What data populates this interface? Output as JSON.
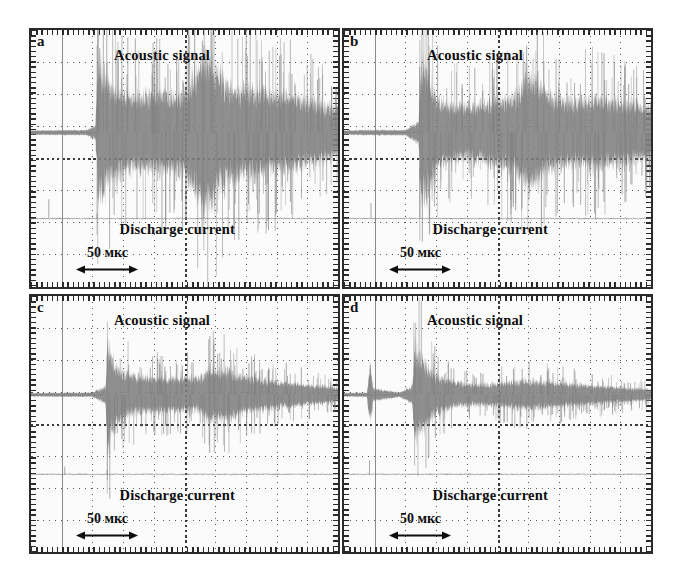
{
  "figure": {
    "type": "oscilloscope-traces",
    "background_color": "#ffffff",
    "trace_color": "#808080",
    "grid_color": "#555555",
    "border_color": "#2a2a2a"
  },
  "common": {
    "acoustic_label": "Acoustic signal",
    "discharge_label": "Discharge current",
    "scalebar_label": "50 мкс",
    "scalebar_arrow": "double-headed-arrow",
    "grid_columns": 10,
    "grid_rows": 8
  },
  "panels": [
    {
      "letter": "a",
      "acoustic_label": "Acoustic signal",
      "discharge_label": "Discharge current",
      "scalebar_label": "50 мкс"
    },
    {
      "letter": "b",
      "acoustic_label": "Acoustic signal",
      "discharge_label": "Discharge current",
      "scalebar_label": "50 мкс"
    },
    {
      "letter": "c",
      "acoustic_label": "Acoustic signal",
      "discharge_label": "Discharge current",
      "scalebar_label": "50 мкс"
    },
    {
      "letter": "d",
      "acoustic_label": "Acoustic signal",
      "discharge_label": "Discharge current",
      "scalebar_label": "50 мкс"
    }
  ],
  "chart_data": {
    "type": "line",
    "title": "",
    "xlabel": "Time",
    "ylabel": "Amplitude",
    "x_scale_bar_us": 50,
    "x_scale_bar_label": "50 мкс",
    "grid": true,
    "legend_position": "in-plot-annotations",
    "panels": [
      {
        "id": "a",
        "traces": [
          {
            "name": "Acoustic signal",
            "baseline_frac": 0.4,
            "onset_frac": 0.215,
            "peak_amplitude_frac": 0.36,
            "envelope": [
              {
                "x": 0.0,
                "amp": 0.01
              },
              {
                "x": 0.18,
                "amp": 0.012
              },
              {
                "x": 0.21,
                "amp": 0.03
              },
              {
                "x": 0.218,
                "amp": 0.33
              },
              {
                "x": 0.235,
                "amp": 0.3
              },
              {
                "x": 0.255,
                "amp": 0.215
              },
              {
                "x": 0.29,
                "amp": 0.19
              },
              {
                "x": 0.33,
                "amp": 0.175
              },
              {
                "x": 0.38,
                "amp": 0.17
              },
              {
                "x": 0.43,
                "amp": 0.185
              },
              {
                "x": 0.47,
                "amp": 0.165
              },
              {
                "x": 0.505,
                "amp": 0.195
              },
              {
                "x": 0.545,
                "amp": 0.3
              },
              {
                "x": 0.565,
                "amp": 0.36
              },
              {
                "x": 0.59,
                "amp": 0.34
              },
              {
                "x": 0.615,
                "amp": 0.265
              },
              {
                "x": 0.65,
                "amp": 0.215
              },
              {
                "x": 0.7,
                "amp": 0.2
              },
              {
                "x": 0.75,
                "amp": 0.19
              },
              {
                "x": 0.8,
                "amp": 0.18
              },
              {
                "x": 0.85,
                "amp": 0.17
              },
              {
                "x": 0.9,
                "amp": 0.15
              },
              {
                "x": 0.95,
                "amp": 0.13
              },
              {
                "x": 1.0,
                "amp": 0.11
              }
            ]
          },
          {
            "name": "Discharge current",
            "baseline_frac": 0.735,
            "spikes": [
              {
                "x": 0.058,
                "depth": 0.075
              },
              {
                "x": 0.215,
                "depth": 0.02
              },
              {
                "x": 0.563,
                "depth": 0.145
              }
            ]
          }
        ]
      },
      {
        "id": "b",
        "traces": [
          {
            "name": "Acoustic signal",
            "baseline_frac": 0.4,
            "onset_frac": 0.245,
            "peak_amplitude_frac": 0.34,
            "envelope": [
              {
                "x": 0.0,
                "amp": 0.01
              },
              {
                "x": 0.085,
                "amp": 0.012
              },
              {
                "x": 0.2,
                "amp": 0.012
              },
              {
                "x": 0.243,
                "amp": 0.05
              },
              {
                "x": 0.25,
                "amp": 0.34
              },
              {
                "x": 0.262,
                "amp": 0.3
              },
              {
                "x": 0.278,
                "amp": 0.27
              },
              {
                "x": 0.3,
                "amp": 0.165
              },
              {
                "x": 0.34,
                "amp": 0.13
              },
              {
                "x": 0.4,
                "amp": 0.125
              },
              {
                "x": 0.46,
                "amp": 0.135
              },
              {
                "x": 0.51,
                "amp": 0.155
              },
              {
                "x": 0.56,
                "amp": 0.175
              },
              {
                "x": 0.6,
                "amp": 0.27
              },
              {
                "x": 0.625,
                "amp": 0.25
              },
              {
                "x": 0.66,
                "amp": 0.18
              },
              {
                "x": 0.71,
                "amp": 0.155
              },
              {
                "x": 0.76,
                "amp": 0.145
              },
              {
                "x": 0.81,
                "amp": 0.16
              },
              {
                "x": 0.86,
                "amp": 0.15
              },
              {
                "x": 0.91,
                "amp": 0.14
              },
              {
                "x": 0.96,
                "amp": 0.125
              },
              {
                "x": 1.0,
                "amp": 0.11
              }
            ]
          },
          {
            "name": "Discharge current",
            "baseline_frac": 0.735,
            "spikes": [
              {
                "x": 0.088,
                "depth": 0.06
              },
              {
                "x": 0.247,
                "depth": 0.2
              },
              {
                "x": 0.278,
                "depth": 0.185
              }
            ]
          }
        ]
      },
      {
        "id": "c",
        "traces": [
          {
            "name": "Acoustic signal",
            "baseline_frac": 0.385,
            "onset_frac": 0.245,
            "peak_amplitude_frac": 0.26,
            "envelope": [
              {
                "x": 0.0,
                "amp": 0.008
              },
              {
                "x": 0.2,
                "amp": 0.01
              },
              {
                "x": 0.243,
                "amp": 0.04
              },
              {
                "x": 0.249,
                "amp": 0.26
              },
              {
                "x": 0.262,
                "amp": 0.18
              },
              {
                "x": 0.28,
                "amp": 0.13
              },
              {
                "x": 0.31,
                "amp": 0.1
              },
              {
                "x": 0.35,
                "amp": 0.085
              },
              {
                "x": 0.4,
                "amp": 0.08
              },
              {
                "x": 0.45,
                "amp": 0.075
              },
              {
                "x": 0.5,
                "amp": 0.08
              },
              {
                "x": 0.545,
                "amp": 0.075
              },
              {
                "x": 0.585,
                "amp": 0.125
              },
              {
                "x": 0.61,
                "amp": 0.11
              },
              {
                "x": 0.645,
                "amp": 0.115
              },
              {
                "x": 0.68,
                "amp": 0.09
              },
              {
                "x": 0.73,
                "amp": 0.075
              },
              {
                "x": 0.79,
                "amp": 0.065
              },
              {
                "x": 0.85,
                "amp": 0.055
              },
              {
                "x": 0.91,
                "amp": 0.045
              },
              {
                "x": 0.96,
                "amp": 0.038
              },
              {
                "x": 1.0,
                "amp": 0.032
              }
            ]
          },
          {
            "name": "Discharge current",
            "baseline_frac": 0.695,
            "spikes": [
              {
                "x": 0.11,
                "depth": 0.03
              },
              {
                "x": 0.248,
                "depth": 0.018
              }
            ]
          }
        ]
      },
      {
        "id": "d",
        "traces": [
          {
            "name": "Acoustic signal",
            "baseline_frac": 0.385,
            "onset_frac": 0.225,
            "peak_amplitude_frac": 0.22,
            "envelope": [
              {
                "x": 0.0,
                "amp": 0.008
              },
              {
                "x": 0.075,
                "amp": 0.01
              },
              {
                "x": 0.085,
                "amp": 0.15
              },
              {
                "x": 0.095,
                "amp": 0.03
              },
              {
                "x": 0.18,
                "amp": 0.01
              },
              {
                "x": 0.222,
                "amp": 0.04
              },
              {
                "x": 0.23,
                "amp": 0.22
              },
              {
                "x": 0.245,
                "amp": 0.18
              },
              {
                "x": 0.262,
                "amp": 0.16
              },
              {
                "x": 0.285,
                "amp": 0.11
              },
              {
                "x": 0.32,
                "amp": 0.075
              },
              {
                "x": 0.37,
                "amp": 0.055
              },
              {
                "x": 0.43,
                "amp": 0.048
              },
              {
                "x": 0.49,
                "amp": 0.052
              },
              {
                "x": 0.55,
                "amp": 0.06
              },
              {
                "x": 0.6,
                "amp": 0.065
              },
              {
                "x": 0.65,
                "amp": 0.06
              },
              {
                "x": 0.7,
                "amp": 0.055
              },
              {
                "x": 0.76,
                "amp": 0.048
              },
              {
                "x": 0.82,
                "amp": 0.042
              },
              {
                "x": 0.88,
                "amp": 0.036
              },
              {
                "x": 0.94,
                "amp": 0.03
              },
              {
                "x": 1.0,
                "amp": 0.026
              }
            ]
          },
          {
            "name": "Discharge current",
            "baseline_frac": 0.695,
            "spikes": [
              {
                "x": 0.083,
                "depth": 0.055
              }
            ]
          }
        ]
      }
    ]
  }
}
